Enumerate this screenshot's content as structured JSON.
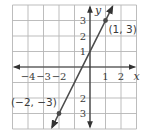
{
  "chart_data": {
    "type": "line",
    "title": "",
    "xlabel": "x",
    "ylabel": "y",
    "xlim": [
      -5,
      3
    ],
    "ylim": [
      -4,
      4
    ],
    "grid": true,
    "x_ticks": [
      {
        "value": -4,
        "label": "−4"
      },
      {
        "value": -3,
        "label": "−3"
      },
      {
        "value": -2,
        "label": "−2"
      },
      {
        "value": 1,
        "label": "1"
      },
      {
        "value": 2,
        "label": "2"
      }
    ],
    "y_ticks": [
      {
        "value": 3,
        "label": "3"
      },
      {
        "value": 2,
        "label": "2"
      },
      {
        "value": 1,
        "label": "1"
      },
      {
        "value": -2,
        "label": "2"
      },
      {
        "value": -3,
        "label": "3"
      }
    ],
    "series": [
      {
        "name": "line through (−2, −3) and (1, 3)",
        "slope": 2,
        "intercept": 1,
        "x": [
          -2,
          1
        ],
        "y": [
          -3,
          3
        ]
      }
    ],
    "points": [
      {
        "x": 1,
        "y": 3,
        "label": "(1, 3)"
      },
      {
        "x": -2,
        "y": -3,
        "label": "(−2, −3)"
      }
    ],
    "colors": {
      "grid": "#b5b5b5",
      "axes": "#333333",
      "line": "#4a4a4a",
      "text": "#3a3a3a"
    }
  }
}
